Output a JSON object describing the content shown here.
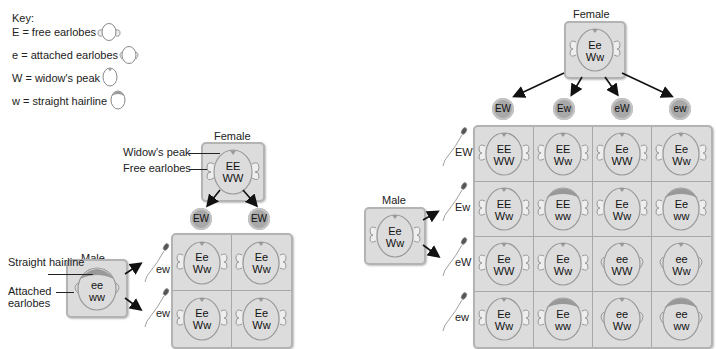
{
  "key": {
    "title": "Key:",
    "items": [
      {
        "label": "E = free earlobes",
        "icon": "free-earlobes-head-icon"
      },
      {
        "label": "e = attached earlobes",
        "icon": "attached-earlobes-head-icon"
      },
      {
        "label": "W = widow's peak",
        "icon": "widows-peak-head-icon"
      },
      {
        "label": "w  = straight hairline",
        "icon": "straight-hairline-head-icon"
      }
    ]
  },
  "cross1": {
    "female": {
      "label": "Female",
      "genotype_line1": "EE",
      "genotype_line2": "WW"
    },
    "female_annotations": [
      "Widow's peak",
      "Free earlobes"
    ],
    "female_gametes": [
      "EW",
      "EW"
    ],
    "male": {
      "label": "Male",
      "genotype_line1": "ee",
      "genotype_line2": "ww"
    },
    "male_annotations": [
      "Straight hairline",
      "Attached earlobes"
    ],
    "male_gametes": [
      "ew",
      "ew"
    ],
    "offspring": [
      [
        {
          "l1": "Ee",
          "l2": "Ww"
        },
        {
          "l1": "Ee",
          "l2": "Ww"
        }
      ],
      [
        {
          "l1": "Ee",
          "l2": "Ww"
        },
        {
          "l1": "Ee",
          "l2": "Ww"
        }
      ]
    ]
  },
  "cross2": {
    "female": {
      "label": "Female",
      "genotype_line1": "Ee",
      "genotype_line2": "Ww"
    },
    "female_gametes": [
      "EW",
      "Ew",
      "eW",
      "ew"
    ],
    "male": {
      "label": "Male",
      "genotype_line1": "Ee",
      "genotype_line2": "Ww"
    },
    "male_gametes": [
      "EW",
      "Ew",
      "eW",
      "ew"
    ],
    "offspring": [
      [
        {
          "l1": "EE",
          "l2": "WW"
        },
        {
          "l1": "EE",
          "l2": "Ww"
        },
        {
          "l1": "Ee",
          "l2": "WW"
        },
        {
          "l1": "Ee",
          "l2": "Ww"
        }
      ],
      [
        {
          "l1": "EE",
          "l2": "Ww"
        },
        {
          "l1": "EE",
          "l2": "ww"
        },
        {
          "l1": "Ee",
          "l2": "Ww"
        },
        {
          "l1": "Ee",
          "l2": "ww"
        }
      ],
      [
        {
          "l1": "Ee",
          "l2": "WW"
        },
        {
          "l1": "Ee",
          "l2": "Ww"
        },
        {
          "l1": "ee",
          "l2": "WW"
        },
        {
          "l1": "ee",
          "l2": "Ww"
        }
      ],
      [
        {
          "l1": "Ee",
          "l2": "Ww"
        },
        {
          "l1": "Ee",
          "l2": "ww"
        },
        {
          "l1": "ee",
          "l2": "Ww"
        },
        {
          "l1": "ee",
          "l2": "ww"
        }
      ]
    ]
  },
  "colors": {
    "box_fill": "#dcdcdc",
    "box_border": "#b3b3b3",
    "hair": "#9a9a9a",
    "gamete_fill": "#a8a8a8",
    "arrow": "#111111"
  }
}
